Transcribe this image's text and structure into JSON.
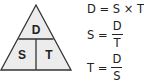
{
  "triangle": {
    "top": "D",
    "bottom_left": "S",
    "bottom_right": "T",
    "fill": "#ececec",
    "stroke": "#333333"
  },
  "equations": [
    {
      "lhs": "D",
      "eq": "=",
      "rhs": "S × T"
    },
    {
      "lhs": "S",
      "eq": "=",
      "numerator": "D",
      "denominator": "T"
    },
    {
      "lhs": "T",
      "eq": "=",
      "numerator": "D",
      "denominator": "S"
    }
  ]
}
